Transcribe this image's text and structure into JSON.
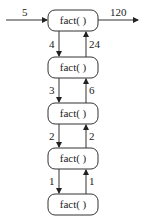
{
  "diagram": {
    "type": "recursion-call-stack",
    "input_label": "5",
    "output_label": "120",
    "boxes": [
      {
        "label": "fact( )"
      },
      {
        "label": "fact( )"
      },
      {
        "label": "fact( )"
      },
      {
        "label": "fact( )"
      },
      {
        "label": "fact( )"
      }
    ],
    "down_labels": [
      "4",
      "3",
      "2",
      "1"
    ],
    "up_labels": [
      "24",
      "6",
      "2",
      "1"
    ]
  },
  "colors": {
    "stroke": "#333333",
    "text": "#222222",
    "background": "#ffffff"
  }
}
